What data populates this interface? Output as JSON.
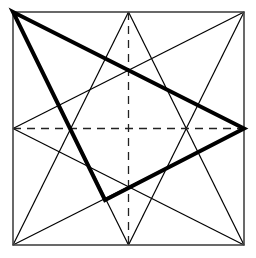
{
  "diagram": {
    "colors": {
      "background": "#ffffff",
      "stroke": "#000000",
      "dashed": "#222222"
    },
    "square": {
      "x1": 13,
      "y1": 12,
      "x2": 244,
      "y2": 245
    },
    "midpoints": {
      "top": [
        128.5,
        12
      ],
      "bottom": [
        128.5,
        245
      ],
      "left": [
        13,
        128.5
      ],
      "right": [
        244,
        128.5
      ]
    },
    "thin_lines": [
      {
        "from": [
          128.5,
          12
        ],
        "to": [
          13,
          245
        ]
      },
      {
        "from": [
          128.5,
          12
        ],
        "to": [
          244,
          245
        ]
      },
      {
        "from": [
          128.5,
          245
        ],
        "to": [
          13,
          12
        ]
      },
      {
        "from": [
          128.5,
          245
        ],
        "to": [
          244,
          12
        ]
      },
      {
        "from": [
          13,
          128.5
        ],
        "to": [
          244,
          12
        ]
      },
      {
        "from": [
          13,
          128.5
        ],
        "to": [
          244,
          245
        ]
      },
      {
        "from": [
          244,
          128.5
        ],
        "to": [
          13,
          12
        ]
      },
      {
        "from": [
          244,
          128.5
        ],
        "to": [
          13,
          245
        ]
      }
    ],
    "dashed_lines": [
      {
        "from": [
          13,
          128.5
        ],
        "to": [
          244,
          128.5
        ]
      },
      {
        "from": [
          128.5,
          12
        ],
        "to": [
          128.5,
          245
        ]
      }
    ],
    "bold_triangle": {
      "vertices": [
        [
          13,
          12
        ],
        [
          244,
          128.5
        ],
        [
          105,
          200
        ]
      ]
    }
  }
}
